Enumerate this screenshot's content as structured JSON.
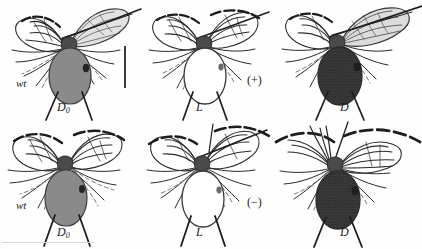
{
  "figure": {
    "background_color": "#fefefe",
    "ink_color": "#1b1b1b"
  },
  "rows": [
    {
      "id": "row-plus",
      "sign_label": "(+)",
      "sign_x": 247,
      "sign_y": 74,
      "panels": [
        {
          "id": "panel-wt-d0-plus",
          "genotype_label": "wt",
          "genotype_x": 16,
          "genotype_y": 78,
          "allele_label": "D",
          "allele_subscript": "0",
          "allele_x": 57,
          "allele_y": 101,
          "abdomen_fill": "#8a8a8a",
          "abdomen_style": "solid-gray",
          "wing_state": "held-out-left-and-spread-right",
          "x": 0,
          "y": 0
        },
        {
          "id": "panel-l-plus",
          "genotype_label": "",
          "genotype_x": 0,
          "genotype_y": 0,
          "allele_label": "L",
          "allele_subscript": "",
          "allele_x": 196,
          "allele_y": 101,
          "abdomen_fill": "#ffffff",
          "abdomen_style": "outline",
          "wing_state": "both-wings-arched",
          "x": 141,
          "y": 0
        },
        {
          "id": "panel-d-plus",
          "genotype_label": "",
          "genotype_x": 0,
          "genotype_y": 0,
          "allele_label": "D",
          "allele_subscript": "",
          "allele_x": 340,
          "allele_y": 101,
          "abdomen_fill": "#6f6f6f",
          "abdomen_style": "stippled-dark",
          "wing_state": "right-wing-outstretched",
          "x": 274,
          "y": 0
        }
      ]
    },
    {
      "id": "row-minus",
      "sign_label": "(−)",
      "sign_x": 247,
      "sign_y": 196,
      "panels": [
        {
          "id": "panel-wt-d0-minus",
          "genotype_label": "wt",
          "genotype_x": 16,
          "genotype_y": 200,
          "allele_label": "D",
          "allele_subscript": "0",
          "allele_x": 57,
          "allele_y": 226,
          "abdomen_fill": "#8a8a8a",
          "abdomen_style": "solid-gray",
          "wing_state": "both-wings-swept-back",
          "x": 0,
          "y": 122
        },
        {
          "id": "panel-l-minus",
          "genotype_label": "",
          "genotype_x": 0,
          "genotype_y": 0,
          "allele_label": "L",
          "allele_subscript": "",
          "allele_x": 196,
          "allele_y": 226,
          "abdomen_fill": "#ffffff",
          "abdomen_style": "outline",
          "wing_state": "wings-raised-crossed",
          "x": 141,
          "y": 122
        },
        {
          "id": "panel-d-minus",
          "genotype_label": "",
          "genotype_x": 0,
          "genotype_y": 0,
          "allele_label": "D",
          "allele_subscript": "",
          "allele_x": 340,
          "allele_y": 226,
          "abdomen_fill": "#6f6f6f",
          "abdomen_style": "stippled-dark",
          "wing_state": "right-wing-fanned",
          "x": 274,
          "y": 122
        }
      ]
    }
  ],
  "scale_bar": {
    "name": "scale-bar",
    "x": 124,
    "y": 46,
    "height": 42,
    "orientation": "vertical",
    "color": "#3a3a3a",
    "caption": ""
  }
}
